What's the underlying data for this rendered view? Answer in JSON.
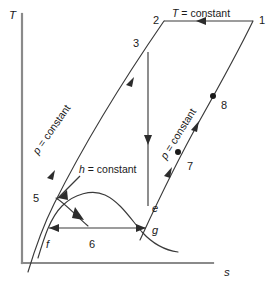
{
  "figure": {
    "type": "temperature-entropy-diagram",
    "axes": {
      "y_label": "T",
      "x_label": "s",
      "y_name": "temperature",
      "x_name": "specific-entropy"
    },
    "annotations": {
      "isotherm": {
        "var": "T",
        "rest": " = constant"
      },
      "isobar_left": {
        "var": "p",
        "rest": " = constant"
      },
      "isobar_right": {
        "var": "p",
        "rest": " = constant"
      },
      "isenthalp": {
        "var": "h",
        "rest": " = constant"
      }
    },
    "state_points": [
      {
        "id": "1",
        "label": "1",
        "x": 253,
        "y": 21,
        "label_x": 259,
        "label_y": 24,
        "dot": false
      },
      {
        "id": "2",
        "label": "2",
        "x": 164,
        "y": 21,
        "label_x": 153,
        "label_y": 24,
        "dot": false
      },
      {
        "id": "3",
        "label": "3",
        "x": 148,
        "y": 52,
        "label_x": 136,
        "label_y": 47,
        "dot": false
      },
      {
        "id": "5",
        "label": "5",
        "x": 56,
        "y": 198,
        "label_x": 35,
        "label_y": 201,
        "dot": false
      },
      {
        "id": "6",
        "label": "6",
        "x": 95,
        "y": 228,
        "label_x": 89,
        "label_y": 245,
        "dot": false
      },
      {
        "id": "7",
        "label": "7",
        "x": 178,
        "y": 152,
        "label_x": 188,
        "label_y": 169,
        "dot": true
      },
      {
        "id": "8",
        "label": "8",
        "x": 213,
        "y": 96,
        "label_x": 222,
        "label_y": 108,
        "dot": true
      },
      {
        "id": "e",
        "label": "e",
        "x": 148,
        "y": 203,
        "label_x": 154,
        "label_y": 211,
        "dot": false
      },
      {
        "id": "g",
        "label": "g",
        "x": 146,
        "y": 224,
        "label_x": 154,
        "label_y": 232,
        "dot": false
      },
      {
        "id": "f",
        "label": "f",
        "x": 49,
        "y": 228,
        "label_x": 48,
        "label_y": 246,
        "dot": false
      }
    ],
    "colors": {
      "axis": "#8a8a8a",
      "curve": "#3a3a3a",
      "text": "#1a1a1a",
      "background": "#ffffff"
    }
  }
}
